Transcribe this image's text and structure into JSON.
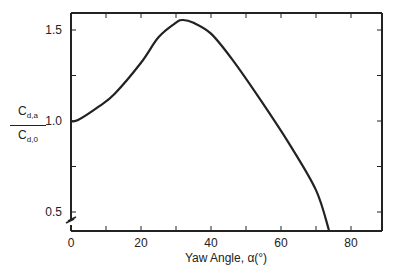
{
  "chart_data": {
    "type": "line",
    "title": "",
    "xlabel": "Yaw Angle, α(°)",
    "ylabel": {
      "numerator": "C",
      "numerator_sub": "d,a",
      "denominator": "C",
      "denominator_sub": "d,0"
    },
    "xlim": [
      0,
      90
    ],
    "ylim": [
      0.4,
      1.57
    ],
    "x_ticks": [
      0,
      20,
      40,
      60,
      80
    ],
    "x_tick_labels": [
      "0",
      "20",
      "40",
      "60",
      "80"
    ],
    "y_ticks": [
      0.5,
      1.0,
      1.5
    ],
    "y_tick_labels": [
      "0.5",
      "1.0",
      "1.5"
    ],
    "grid": false,
    "axis_break": "y-axis break near 0.45",
    "series": [
      {
        "name": "Cd,a/Cd,0",
        "x": [
          0,
          2,
          8,
          12.5,
          20,
          25,
          30,
          32,
          35,
          40,
          46,
          54,
          62.5,
          70,
          73.7
        ],
        "y": [
          1.0,
          1.005,
          1.08,
          1.15,
          1.32,
          1.46,
          1.54,
          1.555,
          1.54,
          1.48,
          1.34,
          1.12,
          0.87,
          0.62,
          0.4
        ]
      }
    ]
  }
}
